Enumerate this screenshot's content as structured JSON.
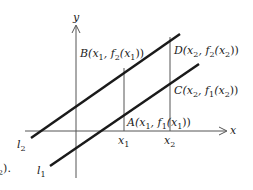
{
  "diagram": {
    "type": "two parallel lines on Cartesian axes",
    "axes": {
      "x_label": "x",
      "y_label": "y"
    },
    "lines": [
      {
        "name": "l2",
        "label_main": "l",
        "label_sub": "2"
      },
      {
        "name": "l1",
        "label_main": "l",
        "label_sub": "1"
      }
    ],
    "ticks": [
      {
        "main": "x",
        "sub": "1"
      },
      {
        "main": "x",
        "sub": "2"
      }
    ],
    "points": {
      "A": {
        "text": "A(x",
        "sub1": "1",
        "mid": ", f",
        "sub2": "1",
        "mid2": "(x",
        "sub3": "1",
        "end": "))"
      },
      "B": {
        "text": "B(x",
        "sub1": "1",
        "mid": ", f",
        "sub2": "2",
        "mid2": "(x",
        "sub3": "1",
        "end": "))"
      },
      "C": {
        "text": "C(x",
        "sub1": "2",
        "mid": ", f",
        "sub2": "1",
        "mid2": "(x",
        "sub3": "2",
        "end": "))"
      },
      "D": {
        "text": "D(x",
        "sub1": "2",
        "mid": ", f",
        "sub2": "2",
        "mid2": "(x",
        "sub3": "2",
        "end": "))"
      }
    },
    "fragment": {
      "main": "",
      "sub": "2",
      "end": ")."
    }
  },
  "colors": {
    "line": "#1a1a1a",
    "axis": "#555555",
    "text": "#222222"
  }
}
